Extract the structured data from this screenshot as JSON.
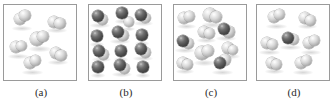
{
  "figure": {
    "type": "molecular-diagram",
    "panel_count": 4,
    "colors": {
      "light_atom": "#b4b4b4",
      "dark_atom": "#4c4c4c",
      "panel_border": "#9a9a9a",
      "background": "#ffffff",
      "label_text": "#2a2a2a"
    }
  },
  "panels": [
    {
      "id": "a",
      "label": "(a)",
      "particle_count": 6,
      "composition": "six light diatomic molecules",
      "molecules": [
        {
          "x": 16,
          "y": 14,
          "atoms": [
            {
              "t": "light",
              "dx": 0,
              "dy": 0,
              "r": 6.4
            },
            {
              "t": "light",
              "dx": 5.0,
              "dy": -3.2,
              "r": 5.6
            }
          ]
        },
        {
          "x": 50,
          "y": 17,
          "atoms": [
            {
              "t": "light",
              "dx": 0,
              "dy": 0,
              "r": 6.0
            },
            {
              "t": "light",
              "dx": 6.0,
              "dy": 1.4,
              "r": 5.6
            }
          ]
        },
        {
          "x": 33,
          "y": 34,
          "atoms": [
            {
              "t": "light",
              "dx": 0,
              "dy": 0,
              "r": 6.6
            },
            {
              "t": "light",
              "dx": 6.2,
              "dy": -2.4,
              "r": 5.8
            }
          ]
        },
        {
          "x": 12,
          "y": 42,
          "atoms": [
            {
              "t": "light",
              "dx": 0,
              "dy": 0,
              "r": 6.2
            },
            {
              "t": "light",
              "dx": 5.6,
              "dy": -1.0,
              "r": 5.4
            }
          ]
        },
        {
          "x": 52,
          "y": 48,
          "atoms": [
            {
              "t": "light",
              "dx": 0,
              "dy": 0,
              "r": 6.2
            },
            {
              "t": "light",
              "dx": 5.0,
              "dy": 2.6,
              "r": 5.6
            }
          ]
        },
        {
          "x": 26,
          "y": 58,
          "atoms": [
            {
              "t": "light",
              "dx": 0,
              "dy": 0,
              "r": 6.4
            },
            {
              "t": "light",
              "dx": 5.6,
              "dy": -2.8,
              "r": 5.6
            }
          ]
        }
      ]
    },
    {
      "id": "b",
      "label": "(b)",
      "particle_count": 13,
      "composition": "seven dark-and-light molecules with six single light spheres",
      "molecules": [
        {
          "x": 9,
          "y": 11,
          "atoms": [
            {
              "t": "light",
              "dx": 4.6,
              "dy": 3.4,
              "r": 5.6
            },
            {
              "t": "dark",
              "dx": 0,
              "dy": 0,
              "r": 6.2
            }
          ]
        },
        {
          "x": 33,
          "y": 8,
          "atoms": [
            {
              "t": "dark",
              "dx": 0,
              "dy": 0,
              "r": 5.6
            }
          ]
        },
        {
          "x": 52,
          "y": 10,
          "atoms": [
            {
              "t": "light",
              "dx": 4.8,
              "dy": 3.0,
              "r": 5.4
            },
            {
              "t": "dark",
              "dx": 0,
              "dy": 0,
              "r": 6.0
            }
          ]
        },
        {
          "x": 8,
          "y": 31,
          "atoms": [
            {
              "t": "dark",
              "dx": 0,
              "dy": 0,
              "r": 5.6
            }
          ]
        },
        {
          "x": 29,
          "y": 27,
          "atoms": [
            {
              "t": "light",
              "dx": 5.0,
              "dy": 3.4,
              "r": 5.6
            },
            {
              "t": "dark",
              "dx": 0,
              "dy": 0,
              "r": 6.2
            }
          ]
        },
        {
          "x": 53,
          "y": 30,
          "atoms": [
            {
              "t": "dark",
              "dx": 0,
              "dy": 0,
              "r": 5.6
            }
          ]
        },
        {
          "x": 10,
          "y": 46,
          "atoms": [
            {
              "t": "light",
              "dx": 4.8,
              "dy": 3.2,
              "r": 5.4
            },
            {
              "t": "dark",
              "dx": 0,
              "dy": 0,
              "r": 6.0
            }
          ]
        },
        {
          "x": 32,
          "y": 46,
          "atoms": [
            {
              "t": "dark",
              "dx": 0,
              "dy": 0,
              "r": 5.6
            }
          ]
        },
        {
          "x": 52,
          "y": 44,
          "atoms": [
            {
              "t": "light",
              "dx": 4.6,
              "dy": 3.4,
              "r": 5.4
            },
            {
              "t": "dark",
              "dx": 0,
              "dy": 0,
              "r": 6.2
            }
          ]
        },
        {
          "x": 9,
          "y": 62,
          "atoms": [
            {
              "t": "dark",
              "dx": 0,
              "dy": 0,
              "r": 5.6
            }
          ]
        },
        {
          "x": 31,
          "y": 60,
          "atoms": [
            {
              "t": "light",
              "dx": 4.8,
              "dy": 3.2,
              "r": 5.6
            },
            {
              "t": "dark",
              "dx": 0,
              "dy": 0,
              "r": 6.2
            }
          ]
        },
        {
          "x": 54,
          "y": 62,
          "atoms": [
            {
              "t": "dark",
              "dx": 0,
              "dy": 0,
              "r": 5.6
            }
          ]
        },
        {
          "x": 40,
          "y": 17,
          "atoms": [
            {
              "t": "light",
              "dx": 0,
              "dy": 0,
              "r": 4.6
            }
          ]
        }
      ]
    },
    {
      "id": "c",
      "label": "(c)",
      "particle_count": 9,
      "composition": "six light molecules and three dark-and-light molecules",
      "molecules": [
        {
          "x": 10,
          "y": 13,
          "atoms": [
            {
              "t": "light",
              "dx": 0,
              "dy": 0,
              "r": 6.0
            },
            {
              "t": "light",
              "dx": 5.4,
              "dy": -1.6,
              "r": 5.4
            }
          ]
        },
        {
          "x": 36,
          "y": 10,
          "atoms": [
            {
              "t": "light",
              "dx": 0,
              "dy": 0,
              "r": 6.6
            },
            {
              "t": "light",
              "dx": 5.8,
              "dy": 2.0,
              "r": 5.8
            }
          ]
        },
        {
          "x": 30,
          "y": 27,
          "atoms": [
            {
              "t": "light",
              "dx": 0,
              "dy": 0,
              "r": 6.0
            },
            {
              "t": "light",
              "dx": 5.4,
              "dy": 1.6,
              "r": 5.4
            }
          ]
        },
        {
          "x": 50,
          "y": 24,
          "atoms": [
            {
              "t": "light",
              "dx": 5.0,
              "dy": 3.0,
              "r": 5.6
            },
            {
              "t": "dark",
              "dx": 0,
              "dy": 0,
              "r": 6.2
            }
          ]
        },
        {
          "x": 9,
          "y": 36,
          "atoms": [
            {
              "t": "light",
              "dx": 5.2,
              "dy": 2.8,
              "r": 5.6
            },
            {
              "t": "dark",
              "dx": 0,
              "dy": 0,
              "r": 6.2
            }
          ]
        },
        {
          "x": 54,
          "y": 43,
          "atoms": [
            {
              "t": "light",
              "dx": 0,
              "dy": 0,
              "r": 5.8
            },
            {
              "t": "light",
              "dx": 4.8,
              "dy": 1.8,
              "r": 5.2
            }
          ]
        },
        {
          "x": 28,
          "y": 48,
          "atoms": [
            {
              "t": "light",
              "dx": 0,
              "dy": 0,
              "r": 6.6
            },
            {
              "t": "light",
              "dx": 5.8,
              "dy": -1.8,
              "r": 5.8
            }
          ]
        },
        {
          "x": 9,
          "y": 58,
          "atoms": [
            {
              "t": "light",
              "dx": 0,
              "dy": 0,
              "r": 5.8
            },
            {
              "t": "light",
              "dx": 4.6,
              "dy": 1.6,
              "r": 5.2
            }
          ]
        },
        {
          "x": 46,
          "y": 58,
          "atoms": [
            {
              "t": "light",
              "dx": 5.4,
              "dy": -2.6,
              "r": 6.0
            },
            {
              "t": "dark",
              "dx": 0,
              "dy": 0,
              "r": 6.4
            }
          ]
        }
      ]
    },
    {
      "id": "d",
      "label": "(d)",
      "particle_count": 7,
      "composition": "six light molecules and one dark-and-light molecule",
      "molecules": [
        {
          "x": 17,
          "y": 12,
          "atoms": [
            {
              "t": "light",
              "dx": 0,
              "dy": 0,
              "r": 6.2
            },
            {
              "t": "light",
              "dx": 5.4,
              "dy": -2.6,
              "r": 5.6
            }
          ]
        },
        {
          "x": 48,
          "y": 13,
          "atoms": [
            {
              "t": "light",
              "dx": 0,
              "dy": 0,
              "r": 6.0
            },
            {
              "t": "light",
              "dx": 5.2,
              "dy": 2.2,
              "r": 5.4
            }
          ]
        },
        {
          "x": 31,
          "y": 33,
          "atoms": [
            {
              "t": "light",
              "dx": 5.6,
              "dy": 1.4,
              "r": 5.8
            },
            {
              "t": "dark",
              "dx": 0,
              "dy": 0,
              "r": 6.2
            }
          ]
        },
        {
          "x": 10,
          "y": 38,
          "atoms": [
            {
              "t": "light",
              "dx": 0,
              "dy": 0,
              "r": 6.2
            },
            {
              "t": "light",
              "dx": 5.4,
              "dy": 1.6,
              "r": 5.6
            }
          ]
        },
        {
          "x": 52,
          "y": 38,
          "atoms": [
            {
              "t": "light",
              "dx": 0,
              "dy": 0,
              "r": 6.2
            },
            {
              "t": "light",
              "dx": 5.2,
              "dy": -2.2,
              "r": 5.6
            }
          ]
        },
        {
          "x": 15,
          "y": 58,
          "atoms": [
            {
              "t": "light",
              "dx": 0,
              "dy": 0,
              "r": 6.0
            },
            {
              "t": "light",
              "dx": 4.8,
              "dy": 1.6,
              "r": 5.4
            }
          ]
        },
        {
          "x": 44,
          "y": 58,
          "atoms": [
            {
              "t": "light",
              "dx": 0,
              "dy": 0,
              "r": 6.4
            },
            {
              "t": "light",
              "dx": 5.2,
              "dy": -2.2,
              "r": 5.6
            }
          ]
        }
      ]
    }
  ],
  "layout": {
    "panel_left_offsets": [
      3,
      88,
      173,
      256
    ],
    "panel_width": 74,
    "panel_height": 77,
    "panel_top": 4
  }
}
